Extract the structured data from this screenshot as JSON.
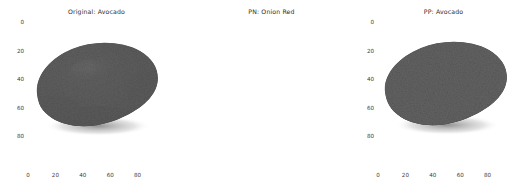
{
  "figure": {
    "width": 525,
    "height": 190,
    "background": "#ffffff",
    "panel_count": 3
  },
  "panels": [
    {
      "id": "panel-1",
      "title": "Original: Avocado",
      "image_kind": "photograph",
      "subject": "avocado",
      "colors": {
        "skin_dark": "#3a3a3a",
        "skin_mid": "#555555",
        "highlight": "#9a9a9a",
        "shadow": "#1f1f1f",
        "background": "#ffffff"
      },
      "xticks": [
        "0",
        "20",
        "40",
        "60",
        "80"
      ],
      "yticks": [
        "0",
        "20",
        "40",
        "60",
        "80"
      ],
      "xtick_values": [
        0,
        20,
        40,
        60,
        80
      ],
      "ytick_values": [
        0,
        20,
        40,
        60,
        80
      ],
      "xlim": [
        0,
        100
      ],
      "ylim": [
        100,
        0
      ],
      "border": false
    },
    {
      "id": "panel-2",
      "title": "PN: Onion Red",
      "image_kind": "photograph",
      "subject": "avocado",
      "colors": {
        "skin_dark": "#3c3c3c",
        "skin_mid": "#565656",
        "highlight": "#909090",
        "shadow": "#202020",
        "background": "#ffffff"
      },
      "xticks": [
        "0",
        "20",
        "40",
        "60",
        "80"
      ],
      "yticks": [
        "0",
        "20",
        "40",
        "60",
        "80"
      ],
      "xtick_values": [
        0,
        20,
        40,
        60,
        80
      ],
      "ytick_values": [
        0,
        20,
        40,
        60,
        80
      ],
      "xlim": [
        0,
        100
      ],
      "ylim": [
        100,
        0
      ],
      "border": false
    },
    {
      "id": "panel-3",
      "title": "PP: Avocado",
      "image_kind": "perturbation-map",
      "subject": "avocado",
      "colors": {
        "background": "#050505",
        "noise_low": "#141414",
        "noise_mid": "#2e2e2e",
        "noise_bright": "#cfcfcf",
        "border": "#4a4a4a"
      },
      "xticks": [
        "0",
        "20",
        "40",
        "60",
        "80"
      ],
      "yticks": [
        "0",
        "20",
        "40",
        "60",
        "80"
      ],
      "xtick_values": [
        0,
        20,
        40,
        60,
        80
      ],
      "ytick_values": [
        0,
        20,
        40,
        60,
        80
      ],
      "xlim": [
        0,
        100
      ],
      "ylim": [
        100,
        0
      ],
      "border": true,
      "bright_clusters": [
        {
          "cx": 48,
          "cy": 8,
          "label": "top-center-streak"
        },
        {
          "cx": 64,
          "cy": 75,
          "label": "lower-right-dot"
        }
      ]
    }
  ]
}
